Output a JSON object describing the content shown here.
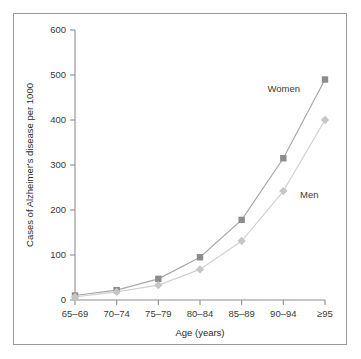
{
  "figure": {
    "border_color": "#9a9a9a",
    "background": "#ffffff"
  },
  "chart_data": {
    "type": "line",
    "title": "",
    "subtitle": "",
    "xlabel": "Age (years)",
    "ylabel": "Cases of Alzheimer's disease per 1000",
    "categories": [
      "65–69",
      "70–74",
      "75–79",
      "80–84",
      "85–89",
      "90–94",
      "≥95"
    ],
    "ylim": [
      0,
      600
    ],
    "yticks": [
      0,
      100,
      200,
      300,
      400,
      500,
      600
    ],
    "ytick_labels": [
      "0",
      "100",
      "200",
      "300",
      "400",
      "500",
      "600"
    ],
    "grid": false,
    "legend_position": "inline-annotation",
    "series": [
      {
        "name": "Women",
        "values": [
          10,
          22,
          47,
          95,
          178,
          315,
          490
        ],
        "color": "#8c8c8c",
        "line_color": "#a8a8a8",
        "marker": "square"
      },
      {
        "name": "Men",
        "values": [
          7,
          18,
          33,
          68,
          131,
          242,
          400
        ],
        "color": "#c6c6c6",
        "line_color": "#d2d2d2",
        "marker": "diamond"
      }
    ],
    "annotations": [
      {
        "text": "Women",
        "series": "Women"
      },
      {
        "text": "Men",
        "series": "Men"
      }
    ]
  },
  "axes": {
    "y_axis_color": "#8d8d8d",
    "x_axis_color": "#8d8d8d"
  }
}
